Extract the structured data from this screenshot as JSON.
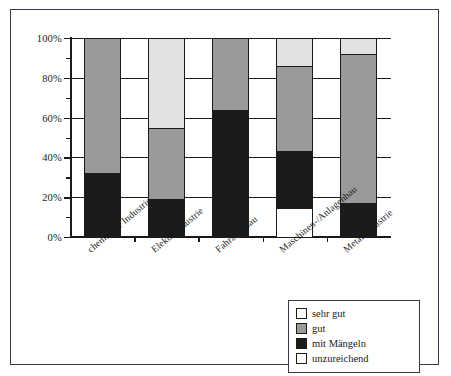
{
  "chart_data": {
    "type": "bar",
    "subtype": "stacked-100-percent",
    "title": "",
    "xlabel": "",
    "ylabel": "",
    "ylim": [
      0,
      100
    ],
    "ytick_labels": [
      "0%",
      "20%",
      "40%",
      "60%",
      "80%",
      "100%"
    ],
    "ytick_values": [
      0,
      20,
      40,
      60,
      80,
      100
    ],
    "yminor_values": [
      10,
      30,
      50,
      70,
      90
    ],
    "grid": true,
    "legend_position": "bottom-right",
    "categories": [
      "chemische Industrie",
      "Elektroindustrie",
      "Fahrzeugbau",
      "Maschinen-/Anlagenbau",
      "Metallindustrie"
    ],
    "series": [
      {
        "name": "unzureichend",
        "color": "#ffffff",
        "values": [
          0,
          0,
          0,
          14,
          0
        ]
      },
      {
        "name": "mit Mängeln",
        "color": "#1b1b1b",
        "values": [
          32,
          19,
          64,
          29,
          17
        ]
      },
      {
        "name": "gut",
        "color": "#9a9a9a",
        "values": [
          68,
          36,
          36,
          43,
          75
        ]
      },
      {
        "name": "sehr gut",
        "color": "#e2e2e2",
        "values": [
          0,
          45,
          0,
          14,
          8
        ]
      }
    ],
    "stack_order_bottom_to_top": [
      "unzureichend",
      "mit Mängeln",
      "gut",
      "sehr gut"
    ]
  },
  "legend": {
    "items": [
      {
        "label": "sehr gut",
        "swatch": "sehrgut"
      },
      {
        "label": "gut",
        "swatch": "gut"
      },
      {
        "label": "mit Mängeln",
        "swatch": "maengeln"
      },
      {
        "label": "unzureichend",
        "swatch": "unzureichend"
      }
    ]
  }
}
